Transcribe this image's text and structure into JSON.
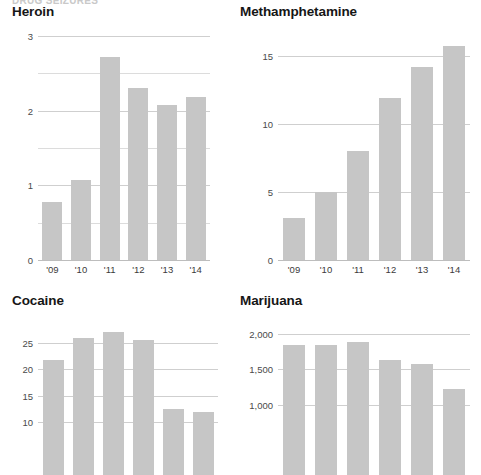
{
  "page": {
    "clipped_header": "DRUG SEIZURES",
    "bar_color": "#c6c6c6",
    "gridline_color": "#cfcfcf",
    "text_color": "#161616"
  },
  "panels": [
    {
      "key": "heroin",
      "title": "Heroin",
      "x": 12,
      "y": 4,
      "plot": {
        "left": 38,
        "top": 36,
        "width": 172,
        "height": 224
      },
      "label_y": 264
    },
    {
      "key": "methamphetamine",
      "title": "Methamphetamine",
      "x": 240,
      "y": 4,
      "plot": {
        "left": 278,
        "top": 36,
        "width": 192,
        "height": 224
      },
      "label_y": 264
    },
    {
      "key": "cocaine",
      "title": "Cocaine",
      "x": 12,
      "y": 293,
      "plot": {
        "left": 38,
        "top": 325,
        "width": 180,
        "height": 150
      },
      "label_y": 0
    },
    {
      "key": "marijuana",
      "title": "Marijuana",
      "x": 240,
      "y": 293,
      "plot": {
        "left": 278,
        "top": 325,
        "width": 192,
        "height": 150
      },
      "label_y": 0
    }
  ],
  "chart_data": [
    {
      "key": "heroin",
      "type": "bar",
      "title": "Heroin",
      "xlabel": "",
      "ylabel": "",
      "categories": [
        "'09",
        "'10",
        "'11",
        "'12",
        "'13",
        "'14"
      ],
      "values": [
        0.78,
        1.07,
        2.72,
        2.3,
        2.07,
        2.18
      ],
      "ylim": [
        0,
        3
      ],
      "yticks": [
        0,
        1,
        2,
        3
      ],
      "ytick_labels": [
        "0",
        "1",
        "2",
        "3"
      ],
      "minor_gridlines": [
        0.5,
        1.5,
        2.5
      ],
      "grid": true,
      "legend": "none",
      "clipped_bottom": false
    },
    {
      "key": "methamphetamine",
      "type": "bar",
      "title": "Methamphetamine",
      "xlabel": "",
      "ylabel": "",
      "categories": [
        "'09",
        "'10",
        "'11",
        "'12",
        "'13",
        "'14"
      ],
      "values": [
        3.1,
        5.0,
        8.0,
        11.9,
        14.2,
        15.8
      ],
      "ylim": [
        0,
        16.5
      ],
      "yticks": [
        0,
        5,
        10,
        15
      ],
      "ytick_labels": [
        "0",
        "5",
        "10",
        "15"
      ],
      "minor_gridlines": [],
      "grid": true,
      "legend": "none",
      "clipped_bottom": false
    },
    {
      "key": "cocaine",
      "type": "bar",
      "title": "Cocaine",
      "xlabel": "",
      "ylabel": "",
      "categories": [
        "'09",
        "'10",
        "'11",
        "'12",
        "'13",
        "'14"
      ],
      "values": [
        21.8,
        26.0,
        27.0,
        25.6,
        12.5,
        12.0
      ],
      "ylim": [
        0,
        28.4
      ],
      "yticks": [
        10,
        15,
        20,
        25
      ],
      "ytick_labels": [
        "10",
        "15",
        "20",
        "25"
      ],
      "minor_gridlines": [],
      "grid": true,
      "legend": "none",
      "clipped_bottom": true
    },
    {
      "key": "marijuana",
      "type": "bar",
      "title": "Marijuana",
      "xlabel": "",
      "ylabel": "",
      "categories": [
        "'09",
        "'10",
        "'11",
        "'12",
        "'13",
        "'14"
      ],
      "values": [
        1850,
        1840,
        1890,
        1640,
        1570,
        1220
      ],
      "ylim": [
        0,
        2130
      ],
      "yticks": [
        1000,
        1500,
        2000
      ],
      "ytick_labels": [
        "1,000",
        "1,500",
        "2,000"
      ],
      "minor_gridlines": [],
      "grid": true,
      "legend": "none",
      "clipped_bottom": true
    }
  ]
}
